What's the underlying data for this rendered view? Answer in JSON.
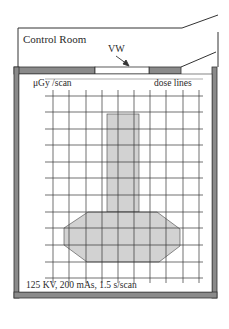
{
  "diagram": {
    "rooms": {
      "control_room": "Control Room",
      "viewing_window": "VW"
    },
    "labels": {
      "units": "μGy /scan",
      "legend": "dose lines",
      "technique": "125 KV, 200 mAs, 1.5 s/scan"
    },
    "colors": {
      "wall": "#8a8a8a",
      "wall_outline": "#333333",
      "grid": "#333333",
      "fill": "#d2d2d2",
      "background": "#ffffff"
    },
    "grid": {
      "x_lines": [
        53,
        69,
        86,
        102,
        118,
        134,
        150,
        166,
        183,
        199
      ],
      "y_lines": [
        96,
        112,
        129,
        145,
        162,
        178,
        195,
        212,
        228,
        245,
        262,
        278
      ],
      "x_extent": [
        45,
        203
      ],
      "y_extent": [
        90,
        283
      ]
    },
    "shapes": {
      "column": {
        "x": 107,
        "y": 114,
        "width": 32,
        "height": 98
      },
      "octagon": [
        [
          88,
          212
        ],
        [
          157,
          212
        ],
        [
          180,
          229
        ],
        [
          180,
          246
        ],
        [
          159,
          262
        ],
        [
          87,
          262
        ],
        [
          64,
          245
        ],
        [
          64,
          228
        ]
      ]
    }
  }
}
